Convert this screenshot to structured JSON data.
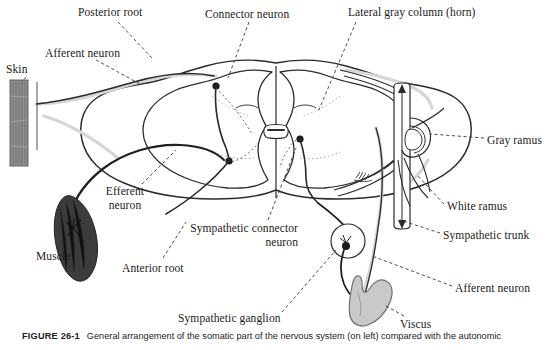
{
  "figure": {
    "number": "FIGURE 26-1",
    "caption": "General arrangement of the somatic part of the nervous system (on left) compared with the autonomic"
  },
  "colors": {
    "ink": "#1a1a1a",
    "outline": "#2b2b2b",
    "nerve_dark": "#2a2a2a",
    "nerve_light": "#d4d4d4",
    "viscus_fill": "#c9c9c9",
    "viscus_outline": "#6e6e6e",
    "muscle_fill": "#3c3c3c",
    "skin_fill": "#8f8f8f",
    "background": "#ffffff",
    "leader_line": "#3a3a3a"
  },
  "labels": [
    {
      "id": "posterior-root",
      "text": "Posterior root",
      "lines": [
        "Posterior root"
      ],
      "x": 78,
      "y": 6,
      "align": "left"
    },
    {
      "id": "connector-neuron",
      "text": "Connector neuron",
      "lines": [
        "Connector neuron"
      ],
      "x": 205,
      "y": 8,
      "align": "left"
    },
    {
      "id": "lateral-gray-column",
      "text": "Lateral gray column (horn)",
      "lines": [
        "Lateral gray column (horn)"
      ],
      "x": 348,
      "y": 6,
      "align": "left"
    },
    {
      "id": "afferent-neuron-left",
      "text": "Afferent neuron",
      "lines": [
        "Afferent neuron"
      ],
      "x": 45,
      "y": 47,
      "align": "left"
    },
    {
      "id": "skin",
      "text": "Skin",
      "lines": [
        "Skin"
      ],
      "x": 6,
      "y": 63,
      "align": "left"
    },
    {
      "id": "efferent-neuron",
      "text": "Efferent neuron",
      "lines": [
        "Efferent",
        "neuron"
      ],
      "x": 99,
      "y": 185,
      "align": "center"
    },
    {
      "id": "muscle",
      "text": "Muscle",
      "lines": [
        "Muscle"
      ],
      "x": 36,
      "y": 250,
      "align": "left"
    },
    {
      "id": "sympathetic-connector-neuron",
      "text": "Sympathetic connector neuron",
      "lines": [
        "Sympathetic connector",
        "neuron"
      ],
      "x": 168,
      "y": 222,
      "align": "right"
    },
    {
      "id": "anterior-root",
      "text": "Anterior root",
      "lines": [
        "Anterior root"
      ],
      "x": 122,
      "y": 262,
      "align": "left"
    },
    {
      "id": "sympathetic-ganglion",
      "text": "Sympathetic ganglion",
      "lines": [
        "Sympathetic ganglion"
      ],
      "x": 178,
      "y": 312,
      "align": "left"
    },
    {
      "id": "viscus",
      "text": "Viscus",
      "lines": [
        "Viscus"
      ],
      "x": 400,
      "y": 318,
      "align": "left"
    },
    {
      "id": "gray-ramus",
      "text": "Gray ramus",
      "lines": [
        "Gray ramus"
      ],
      "x": 487,
      "y": 134,
      "align": "left"
    },
    {
      "id": "white-ramus",
      "text": "White ramus",
      "lines": [
        "White ramus"
      ],
      "x": 447,
      "y": 200,
      "align": "left"
    },
    {
      "id": "sympathetic-trunk",
      "text": "Sympathetic trunk",
      "lines": [
        "Sympathetic trunk"
      ],
      "x": 443,
      "y": 229,
      "align": "left"
    },
    {
      "id": "afferent-neuron-right",
      "text": "Afferent neuron",
      "lines": [
        "Afferent neuron"
      ],
      "x": 455,
      "y": 282,
      "align": "left"
    }
  ],
  "structures": [
    {
      "id": "spinal-cord",
      "name": "spinal cord cross-section"
    },
    {
      "id": "gray-matter",
      "name": "butterfly-shaped gray matter"
    },
    {
      "id": "central-canal",
      "name": "central canal"
    },
    {
      "id": "skin-patch",
      "name": "skin tissue strip"
    },
    {
      "id": "muscle-body",
      "name": "skeletal muscle spindle"
    },
    {
      "id": "viscus-organ",
      "name": "visceral organ"
    },
    {
      "id": "sympathetic-trunk-chain",
      "name": "sympathetic trunk chain"
    },
    {
      "id": "sympathetic-ganglion-node",
      "name": "peripheral sympathetic ganglion"
    }
  ]
}
